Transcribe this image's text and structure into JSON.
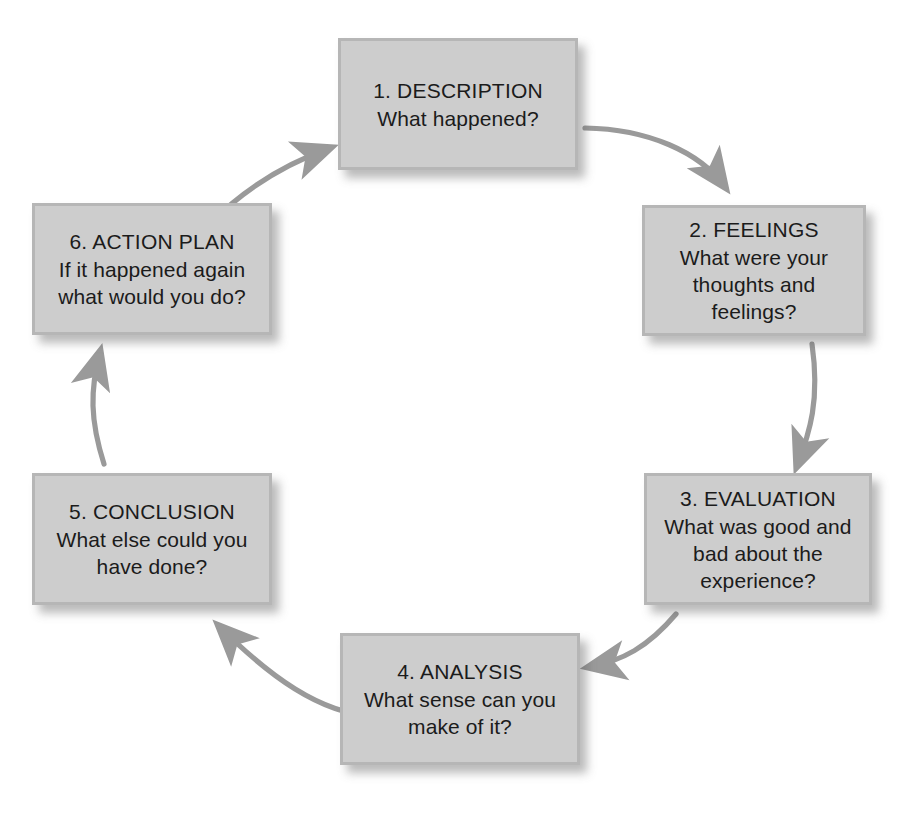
{
  "diagram": {
    "type": "cycle-diagram",
    "direction": "clockwise",
    "colors": {
      "node_fill": "#cdcdcd",
      "node_border": "#b6b6b6",
      "arrow": "#9a9a9a",
      "text": "#1b1b1b",
      "background": "#ffffff"
    },
    "nodes": [
      {
        "id": "description",
        "title": "1. DESCRIPTION",
        "body": "What happened?"
      },
      {
        "id": "feelings",
        "title": "2. FEELINGS",
        "body": "What were your thoughts and feelings?"
      },
      {
        "id": "evaluation",
        "title": "3. EVALUATION",
        "body": "What was good and bad about the experience?"
      },
      {
        "id": "analysis",
        "title": "4. ANALYSIS",
        "body": "What sense can you make of it?"
      },
      {
        "id": "conclusion",
        "title": "5. CONCLUSION",
        "body": "What else could you have done?"
      },
      {
        "id": "action-plan",
        "title": "6. ACTION PLAN",
        "body": "If it happened again what would you do?"
      }
    ],
    "edges": [
      {
        "from": "description",
        "to": "feelings"
      },
      {
        "from": "feelings",
        "to": "evaluation"
      },
      {
        "from": "evaluation",
        "to": "analysis"
      },
      {
        "from": "analysis",
        "to": "conclusion"
      },
      {
        "from": "conclusion",
        "to": "action-plan"
      },
      {
        "from": "action-plan",
        "to": "description"
      }
    ]
  }
}
